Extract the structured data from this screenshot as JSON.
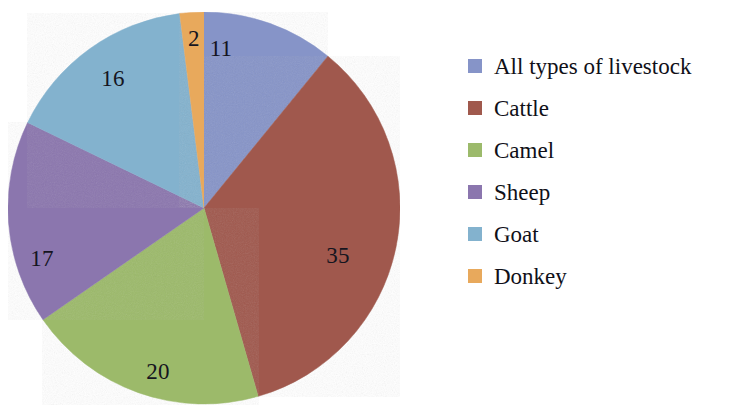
{
  "chart_data": {
    "type": "pie",
    "title": "",
    "subtitle": "",
    "xlabel": "",
    "ylabel": "",
    "grid": false,
    "legend_position": "right",
    "start_angle_deg": 0,
    "direction": "clockwise",
    "total": 101,
    "categories": [
      "All types of livestock",
      "Cattle",
      "Camel",
      "Sheep",
      "Goat",
      "Donkey"
    ],
    "values": [
      11,
      35,
      20,
      17,
      16,
      2
    ],
    "data_labels": [
      "11",
      "35",
      "20",
      "17",
      "16",
      "2"
    ],
    "colors": [
      "#8694c8",
      "#a0594d",
      "#9cba6b",
      "#8b76ae",
      "#83b2ce",
      "#e8a95c"
    ],
    "slices": [
      {
        "label": "All types of livestock",
        "value": 11,
        "data_label": "11",
        "color": "#8694c8"
      },
      {
        "label": "Cattle",
        "value": 35,
        "data_label": "35",
        "color": "#a0594d"
      },
      {
        "label": "Camel",
        "value": 20,
        "data_label": "20",
        "color": "#9cba6b"
      },
      {
        "label": "Sheep",
        "value": 17,
        "data_label": "17",
        "color": "#8b76ae"
      },
      {
        "label": "Goat",
        "value": 16,
        "data_label": "16",
        "color": "#83b2ce"
      },
      {
        "label": "Donkey",
        "value": 2,
        "data_label": "2",
        "color": "#e8a95c"
      }
    ]
  },
  "legend": {
    "items": [
      {
        "label": "All types of livestock",
        "color": "#8694c8"
      },
      {
        "label": "Cattle",
        "color": "#a0594d"
      },
      {
        "label": "Camel",
        "color": "#9cba6b"
      },
      {
        "label": "Sheep",
        "color": "#8b76ae"
      },
      {
        "label": "Goat",
        "color": "#83b2ce"
      },
      {
        "label": "Donkey",
        "color": "#e8a95c"
      }
    ]
  },
  "labels": {
    "all_types_of_livestock": "11",
    "cattle": "35",
    "camel": "20",
    "sheep": "17",
    "goat": "16",
    "donkey": "2"
  }
}
